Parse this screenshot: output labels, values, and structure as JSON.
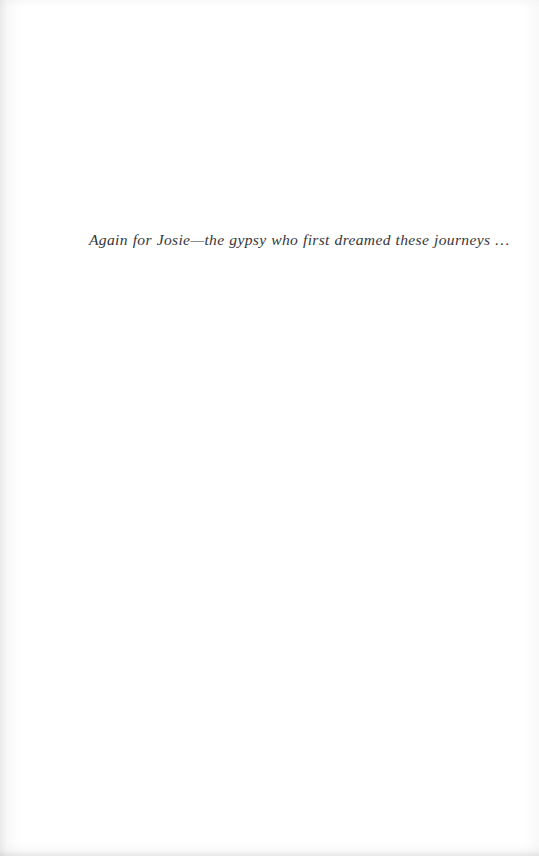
{
  "page": {
    "kind": "book-dedication-page",
    "width": 539,
    "height": 856,
    "background_color": "#ffffff",
    "ink_color": "#2b2b2f"
  },
  "dedication": {
    "text": "Again for Josie—the gypsy who first dreamed these journeys …"
  },
  "scan_artifacts": {
    "left_gutter_shadow": "#9e9e9e",
    "bottom_edge_shadow": "#b0b0b4",
    "right_edge_tone": "#eeeeee"
  }
}
